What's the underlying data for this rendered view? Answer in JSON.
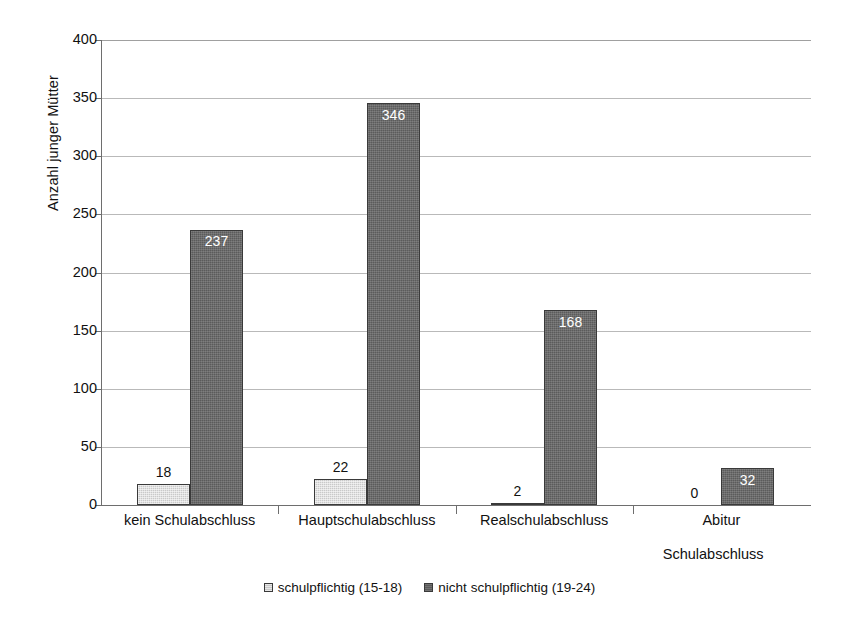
{
  "chart_data": {
    "type": "bar",
    "title": "",
    "xlabel": "Schulabschluss",
    "ylabel": "Anzahl junger Mütter",
    "ylim": [
      0,
      400
    ],
    "ytick_step": 50,
    "yticks": [
      "400",
      "350",
      "300",
      "250",
      "200",
      "150",
      "100",
      "50",
      "0"
    ],
    "grid": true,
    "legend_position": "bottom-center",
    "categories": [
      "kein Schulabschluss",
      "Hauptschulabschluss",
      "Realschulabschluss",
      "Abitur"
    ],
    "series": [
      {
        "name": "schulpflichtig (15-18)",
        "color": "#c9c9c9",
        "values": [
          18,
          22,
          2,
          0
        ],
        "labels": [
          "18",
          "22",
          "2",
          "0"
        ],
        "label_placement": "outside"
      },
      {
        "name": "nicht schulpflichtig (19-24)",
        "color": "#5b5b5b",
        "values": [
          237,
          346,
          168,
          32
        ],
        "labels": [
          "237",
          "346",
          "168",
          "32"
        ],
        "label_placement": "inside"
      }
    ]
  },
  "legend": {
    "items": [
      {
        "label": "schulpflichtig (15-18)"
      },
      {
        "label": "nicht schulpflichtig (19-24)"
      }
    ]
  }
}
